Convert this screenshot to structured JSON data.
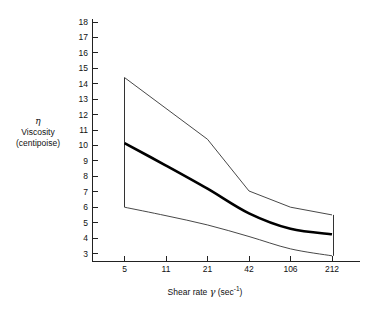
{
  "chart_data": {
    "type": "line",
    "title": "",
    "xlabel": "Shear rate γ (sec⁻¹)",
    "ylabel": "η Viscosity (centipoise)",
    "ylabel_lines": [
      "η",
      "Viscosity",
      "(centipoise)"
    ],
    "x": [
      5,
      11,
      21,
      42,
      106,
      212
    ],
    "categories": [
      "5",
      "11",
      "21",
      "42",
      "106",
      "212"
    ],
    "xtick_labels": [
      "5",
      "11",
      "21",
      "42",
      "106",
      "212"
    ],
    "ytick_labels": [
      "18",
      "17",
      "16",
      "15",
      "14",
      "13",
      "12",
      "11",
      "10",
      "9",
      "8",
      "7",
      "6",
      "5",
      "4",
      "3"
    ],
    "ylim": [
      2.6,
      18.3
    ],
    "xscale": "ordinal-log",
    "grid": false,
    "legend": false,
    "series": [
      {
        "name": "Upper bound",
        "style": "thin",
        "values": [
          14.4,
          12.4,
          10.4,
          7.05,
          6.0,
          5.5
        ]
      },
      {
        "name": "Mean viscosity",
        "style": "bold",
        "values": [
          10.15,
          8.7,
          7.2,
          5.6,
          4.6,
          4.25
        ]
      },
      {
        "name": "Lower bound",
        "style": "thin",
        "values": [
          6.0,
          5.45,
          4.85,
          4.1,
          3.3,
          2.85
        ]
      }
    ],
    "end_caps": [
      {
        "name": "left-cap",
        "x": 5,
        "y_from": 14.4,
        "y_to": 6.0
      },
      {
        "name": "right-cap",
        "x": 212,
        "y_from": 5.5,
        "y_to": 2.85
      }
    ],
    "colors": {
      "axis": "#222222",
      "band": "#333333",
      "mean": "#000000",
      "background": "#ffffff"
    }
  }
}
